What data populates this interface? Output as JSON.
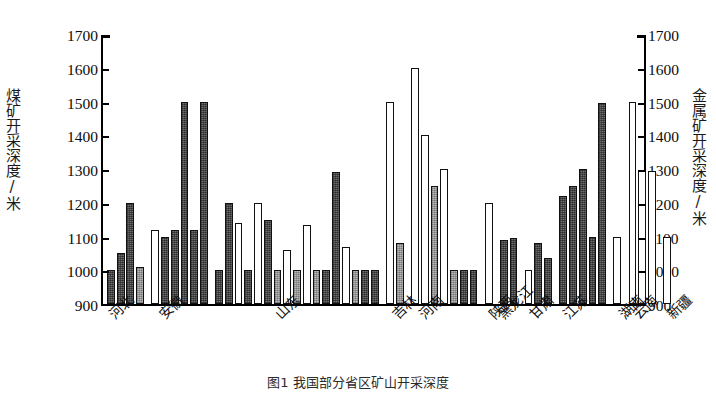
{
  "chart_data": {
    "type": "bar",
    "title": "",
    "caption": "图1  我国部分省区矿山开采深度",
    "ylabel_left": "煤矿开采深度/米",
    "ylabel_right": "金属矿开采深度/米",
    "xlabel": "",
    "ylim": [
      900,
      1700
    ],
    "ytick_step": 100,
    "yticks": [
      "1700",
      "1600",
      "1500",
      "1400",
      "1300",
      "1200",
      "1100",
      "1000",
      "900"
    ],
    "yticks_right": [
      "1700",
      "1600",
      "1500",
      "1400",
      "1300",
      "1200",
      "1100",
      "1000",
      "900"
    ],
    "grid": false,
    "legend": "none",
    "categories": [
      "河北",
      "安徽",
      "山东",
      "吉林",
      "河南",
      "陕西",
      "黑龙江",
      "甘肃",
      "江苏",
      "湖南",
      "云南",
      "新疆"
    ],
    "series": [
      {
        "name": "煤矿开采深度",
        "fill": "dark",
        "color": "#6e6e6e"
      },
      {
        "name": "中等填充",
        "fill": "mid",
        "color": "#b9b9b9"
      },
      {
        "name": "金属矿开采深度",
        "fill": "white",
        "color": "#ffffff"
      }
    ],
    "bars": [
      {
        "group": "河北",
        "value": 1000,
        "fill": "dark"
      },
      {
        "group": "河北",
        "value": 1050,
        "fill": "dark"
      },
      {
        "group": "河北",
        "value": 1200,
        "fill": "dark"
      },
      {
        "group": "河北",
        "value": 1010,
        "fill": "mid"
      },
      {
        "group": "安徽",
        "value": 1120,
        "fill": "white"
      },
      {
        "group": "安徽",
        "value": 1100,
        "fill": "dark"
      },
      {
        "group": "安徽",
        "value": 1120,
        "fill": "dark"
      },
      {
        "group": "安徽",
        "value": 1500,
        "fill": "dark"
      },
      {
        "group": "安徽",
        "value": 1120,
        "fill": "dark"
      },
      {
        "group": "安徽",
        "value": 1500,
        "fill": "dark"
      },
      {
        "group": "山东",
        "value": 1000,
        "fill": "dark"
      },
      {
        "group": "山东",
        "value": 1200,
        "fill": "dark"
      },
      {
        "group": "山东",
        "value": 1140,
        "fill": "white"
      },
      {
        "group": "山东",
        "value": 1000,
        "fill": "dark"
      },
      {
        "group": "山东",
        "value": 1200,
        "fill": "white"
      },
      {
        "group": "山东",
        "value": 1150,
        "fill": "dark"
      },
      {
        "group": "山东",
        "value": 1000,
        "fill": "mid"
      },
      {
        "group": "山东",
        "value": 1060,
        "fill": "white"
      },
      {
        "group": "山东",
        "value": 1000,
        "fill": "mid"
      },
      {
        "group": "山东",
        "value": 1135,
        "fill": "white"
      },
      {
        "group": "山东",
        "value": 1000,
        "fill": "mid"
      },
      {
        "group": "山东",
        "value": 1000,
        "fill": "dark"
      },
      {
        "group": "山东",
        "value": 1290,
        "fill": "dark"
      },
      {
        "group": "山东",
        "value": 1070,
        "fill": "white"
      },
      {
        "group": "山东",
        "value": 1000,
        "fill": "mid"
      },
      {
        "group": "山东",
        "value": 1000,
        "fill": "dark"
      },
      {
        "group": "山东",
        "value": 1000,
        "fill": "dark"
      },
      {
        "group": "吉林",
        "value": 1500,
        "fill": "white"
      },
      {
        "group": "吉林",
        "value": 1080,
        "fill": "mid"
      },
      {
        "group": "河南",
        "value": 1600,
        "fill": "white"
      },
      {
        "group": "河南",
        "value": 1400,
        "fill": "white"
      },
      {
        "group": "河南",
        "value": 1250,
        "fill": "mid"
      },
      {
        "group": "河南",
        "value": 1300,
        "fill": "white"
      },
      {
        "group": "河南",
        "value": 1000,
        "fill": "mid"
      },
      {
        "group": "河南",
        "value": 1000,
        "fill": "dark"
      },
      {
        "group": "河南",
        "value": 1000,
        "fill": "dark"
      },
      {
        "group": "陕西",
        "value": 1200,
        "fill": "white"
      },
      {
        "group": "黑龙江",
        "value": 1090,
        "fill": "dark"
      },
      {
        "group": "黑龙江",
        "value": 1095,
        "fill": "dark"
      },
      {
        "group": "甘肃",
        "value": 1000,
        "fill": "white"
      },
      {
        "group": "甘肃",
        "value": 1080,
        "fill": "dark"
      },
      {
        "group": "甘肃",
        "value": 1035,
        "fill": "dark"
      },
      {
        "group": "江苏",
        "value": 1220,
        "fill": "dark"
      },
      {
        "group": "江苏",
        "value": 1250,
        "fill": "dark"
      },
      {
        "group": "江苏",
        "value": 1300,
        "fill": "dark"
      },
      {
        "group": "江苏",
        "value": 1100,
        "fill": "dark"
      },
      {
        "group": "江苏",
        "value": 1495,
        "fill": "dark"
      },
      {
        "group": "湖南",
        "value": 1100,
        "fill": "white"
      },
      {
        "group": "云南",
        "value": 1500,
        "fill": "white"
      },
      {
        "group": "云南",
        "value": 1295,
        "fill": "white"
      },
      {
        "group": "云南",
        "value": 1295,
        "fill": "white"
      },
      {
        "group": "新疆",
        "value": 1100,
        "fill": "white"
      }
    ]
  }
}
